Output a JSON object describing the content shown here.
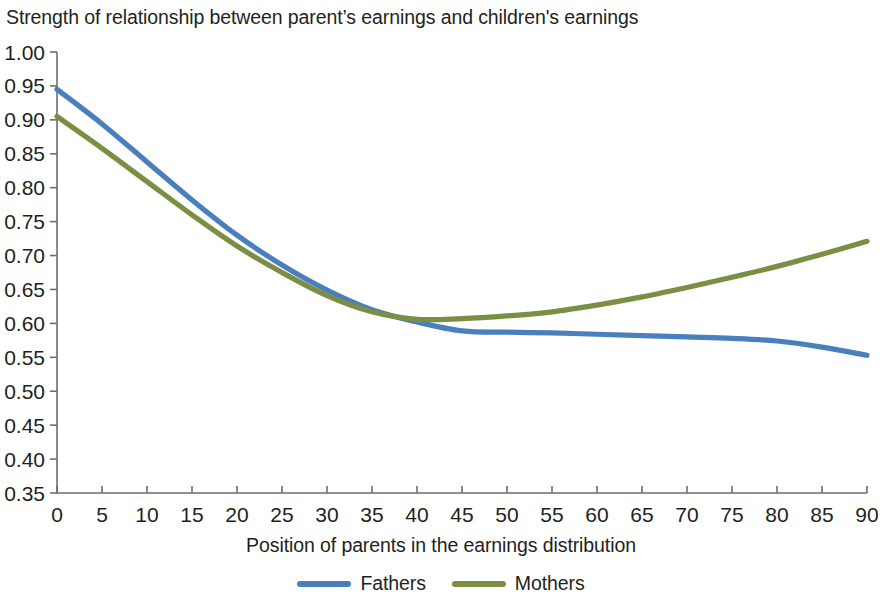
{
  "chart_data": {
    "type": "line",
    "title": "Strength of relationship between parent’s earnings and children's earnings",
    "subtitle": "",
    "xlabel": "Position of parents in the earnings distribution",
    "ylabel": "",
    "xlim": [
      0,
      90
    ],
    "ylim": [
      0.35,
      1.0
    ],
    "grid": false,
    "legend_position": "bottom",
    "xticks": [
      0,
      5,
      10,
      15,
      20,
      25,
      30,
      35,
      40,
      45,
      50,
      55,
      60,
      65,
      70,
      75,
      80,
      85,
      90
    ],
    "xtick_labels": [
      "0",
      "5",
      "10",
      "15",
      "20",
      "25",
      "30",
      "35",
      "40",
      "45",
      "50",
      "55",
      "60",
      "65",
      "70",
      "75",
      "80",
      "85",
      "90"
    ],
    "yticks": [
      0.35,
      0.4,
      0.45,
      0.5,
      0.55,
      0.6,
      0.65,
      0.7,
      0.75,
      0.8,
      0.85,
      0.9,
      0.95,
      1.0
    ],
    "ytick_labels": [
      "0.35",
      "0.40",
      "0.45",
      "0.50",
      "0.55",
      "0.60",
      "0.65",
      "0.70",
      "0.75",
      "0.80",
      "0.85",
      "0.90",
      "0.95",
      "1.00"
    ],
    "x": [
      0,
      5,
      10,
      15,
      20,
      25,
      30,
      35,
      40,
      45,
      50,
      55,
      60,
      65,
      70,
      75,
      80,
      85,
      90
    ],
    "series": [
      {
        "name": "Fathers",
        "color": "#4a7fbe",
        "values": [
          0.945,
          0.894,
          0.838,
          0.782,
          0.73,
          0.686,
          0.649,
          0.62,
          0.602,
          0.589,
          0.587,
          0.586,
          0.584,
          0.582,
          0.58,
          0.578,
          0.574,
          0.565,
          0.553
        ]
      },
      {
        "name": "Mothers",
        "color": "#7b8f42",
        "values": [
          0.905,
          0.858,
          0.809,
          0.76,
          0.714,
          0.675,
          0.641,
          0.617,
          0.606,
          0.607,
          0.611,
          0.617,
          0.627,
          0.639,
          0.653,
          0.668,
          0.684,
          0.702,
          0.721
        ]
      }
    ]
  },
  "legend": {
    "items": [
      {
        "label": "Fathers",
        "color": "#4a7fbe"
      },
      {
        "label": "Mothers",
        "color": "#7b8f42"
      }
    ]
  },
  "axes": {
    "x_title": "Position of parents in the earnings distribution"
  }
}
